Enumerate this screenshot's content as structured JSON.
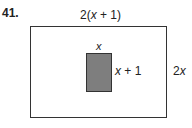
{
  "problem_number": "41.",
  "outer_rect": {
    "width_label_pre": "2(",
    "width_label_var": "x",
    "width_label_post": " + 1)",
    "height_label_pre": "2",
    "height_label_var": "x",
    "fill": "#ffffff"
  },
  "inner_rect": {
    "width_label_var": "x",
    "height_label_var": "x",
    "height_label_post": " + 1",
    "fill": "#7e7e7e"
  }
}
